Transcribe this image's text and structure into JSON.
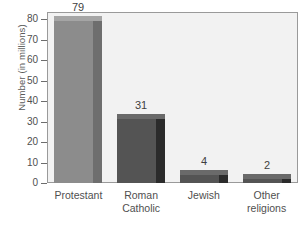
{
  "chart_data": {
    "type": "bar",
    "title": "",
    "xlabel": "",
    "ylabel": "Number (in millions)",
    "categories": [
      "Protestant",
      "Roman\nCatholic",
      "Jewish",
      "Other\nreligions"
    ],
    "values": [
      79,
      31,
      4,
      2
    ],
    "value_labels": [
      "79",
      "31",
      "4",
      "2"
    ],
    "ylim": [
      0,
      80
    ],
    "yticks": [
      0,
      10,
      20,
      30,
      40,
      50,
      60,
      70,
      80
    ],
    "ytick_labels": [
      "0",
      "10",
      "20",
      "30",
      "40",
      "50",
      "60",
      "70",
      "80"
    ],
    "grid": false,
    "legend": "none",
    "style": "3d-bar",
    "colors": {
      "plot_background": "#f2f2f2",
      "plot_border": "#9a9a9a",
      "axis": "#6d6d6d",
      "bar_front_light": "#8c8c8c",
      "bar_side_light": "#6e6e6e",
      "bar_top_light": "#a5a5a5",
      "bar_front_dark": "#545454",
      "bar_side_dark": "#2b2b2b",
      "bar_top_dark": "#6a6a6a",
      "text": "#4f4f4f"
    },
    "bar_shades": [
      "light",
      "dark",
      "dark",
      "dark"
    ]
  }
}
